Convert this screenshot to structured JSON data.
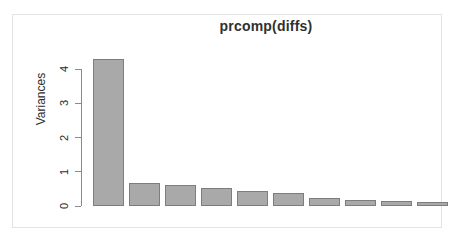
{
  "window": {
    "background_color": "#ffffff",
    "frame_color": "#e3e3e3"
  },
  "chart_data": {
    "type": "bar",
    "title": "prcomp(diffs)",
    "xlabel": "",
    "ylabel": "Variances",
    "categories": [
      "1",
      "2",
      "3",
      "4",
      "5",
      "6",
      "7",
      "8",
      "9",
      "10"
    ],
    "values": [
      4.3,
      0.68,
      0.62,
      0.54,
      0.45,
      0.38,
      0.22,
      0.18,
      0.14,
      0.13
    ],
    "ylim": [
      0,
      4.45
    ],
    "ytick_labels": [
      "0",
      "1",
      "2",
      "3",
      "4"
    ],
    "ytick_values": [
      0,
      1,
      2,
      3,
      4
    ],
    "grid": false,
    "legend": null,
    "bar_fill_color": "#a9a9a9",
    "bar_border_color": "#7d7d7d",
    "axis_color": "#8a8a8a",
    "text_color": "#2b2b2b"
  }
}
